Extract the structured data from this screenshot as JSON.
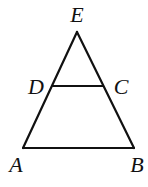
{
  "diagram": {
    "type": "geometry-triangle",
    "points": {
      "E": {
        "label": "E",
        "x": 77,
        "y": 32,
        "label_x": 77,
        "label_y": 22
      },
      "D": {
        "label": "D",
        "x": 53,
        "y": 86,
        "label_x": 36,
        "label_y": 94
      },
      "C": {
        "label": "C",
        "x": 103,
        "y": 86,
        "label_x": 121,
        "label_y": 94
      },
      "A": {
        "label": "A",
        "x": 23,
        "y": 148,
        "label_x": 16,
        "label_y": 172
      },
      "B": {
        "label": "B",
        "x": 134,
        "y": 148,
        "label_x": 137,
        "label_y": 172
      }
    },
    "segments": [
      {
        "name": "EA",
        "from": "E",
        "to": "A"
      },
      {
        "name": "EB",
        "from": "E",
        "to": "B"
      },
      {
        "name": "AB",
        "from": "A",
        "to": "B"
      },
      {
        "name": "DC",
        "from": "D",
        "to": "C"
      }
    ],
    "colors": {
      "stroke": "#111111",
      "label": "#111111",
      "background": "#ffffff"
    }
  }
}
